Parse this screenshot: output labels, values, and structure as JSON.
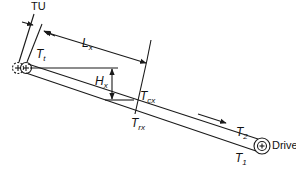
{
  "figure": {
    "type": "belt conveyor tension diagram (inclined)",
    "stroke_color": "#1a1a1a",
    "labels": {
      "take_up": "TU",
      "tail_tension_main": "T",
      "tail_tension_sub": "t",
      "length_main": "L",
      "length_sub": "x",
      "height_main": "H",
      "height_sub": "x",
      "carry_tension_main": "T",
      "carry_tension_sub": "cx",
      "return_tension_main": "T",
      "return_tension_sub": "rx",
      "tight_side_main": "T",
      "tight_side_sub": "2",
      "slack_side_main": "T",
      "slack_side_sub": "1",
      "drive": "Drive"
    }
  }
}
